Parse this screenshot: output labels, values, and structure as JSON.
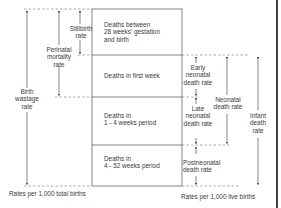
{
  "diagram": {
    "type": "period-rates-diagram",
    "boxes": [
      {
        "id": "stillbirth-period",
        "label": "Deaths between\n28 weeks' gestation\nand birth"
      },
      {
        "id": "first-week",
        "label": "Deaths in first week"
      },
      {
        "id": "one-four-weeks",
        "label": "Deaths in\n1 - 4 weeks period"
      },
      {
        "id": "four-52-weeks",
        "label": "Deaths in\n4 - 52 weeks period"
      }
    ],
    "left_rates": [
      {
        "id": "stillbirth",
        "label": "Stillbirth\nrate",
        "spans": [
          "stillbirth-period"
        ]
      },
      {
        "id": "perinatal",
        "label": "Perinatal\nmortality\nrate",
        "spans": [
          "stillbirth-period",
          "first-week"
        ]
      },
      {
        "id": "birth-wastage",
        "label": "Birth\nwastage\nrate",
        "spans": [
          "stillbirth-period",
          "first-week",
          "one-four-weeks",
          "four-52-weeks"
        ]
      }
    ],
    "right_rates": [
      {
        "id": "early-neonatal",
        "label": "Early\nneonatal\ndeath rate",
        "spans": [
          "first-week"
        ]
      },
      {
        "id": "late-neonatal",
        "label": "Late\nneonatal\ndeath rate",
        "spans": [
          "one-four-weeks"
        ]
      },
      {
        "id": "postneonatal",
        "label": "Postneonatal\ndeath rate",
        "spans": [
          "four-52-weeks"
        ]
      },
      {
        "id": "neonatal",
        "label": "Neonatal\ndeath rate",
        "spans": [
          "first-week",
          "one-four-weeks"
        ]
      },
      {
        "id": "infant",
        "label": "Infant\ndeath\nrate",
        "spans": [
          "first-week",
          "one-four-weeks",
          "four-52-weeks"
        ]
      }
    ],
    "footers": {
      "left": "Rates per 1,000 total births",
      "right": "Rates per 1,000 live births"
    },
    "colors": {
      "line": "#555555",
      "dash": "#777777",
      "text": "#3a3a3a"
    }
  },
  "labels": {
    "box1_l1": "Deaths between",
    "box1_l2": "28 weeks' gestation",
    "box1_l3": "and birth",
    "box2": "Deaths in first week",
    "box3_l1": "Deaths in",
    "box3_l2": "1 - 4 weeks period",
    "box4_l1": "Deaths in",
    "box4_l2": "4 - 52 weeks period",
    "still_l1": "Stillbirth",
    "still_l2": "rate",
    "peri_l1": "Perinatal",
    "peri_l2": "mortality",
    "peri_l3": "rate",
    "bw_l1": "Birth",
    "bw_l2": "wastage",
    "bw_l3": "rate",
    "early_l1": "Early",
    "early_l2": "neonatal",
    "early_l3": "death rate",
    "late_l1": "Late",
    "late_l2": "neonatal",
    "late_l3": "death rate",
    "post_l1": "Postneonatal",
    "post_l2": "death rate",
    "neo_l1": "Neonatal",
    "neo_l2": "death rate",
    "inf_l1": "Infant",
    "inf_l2": "death",
    "inf_l3": "rate",
    "foot_left": "Rates per 1,000 total births",
    "foot_right": "Rates per 1,000 live births"
  }
}
